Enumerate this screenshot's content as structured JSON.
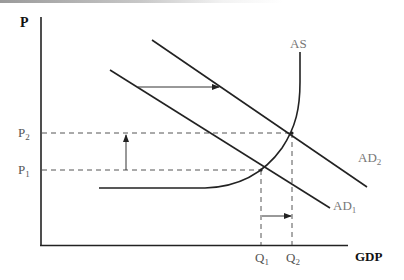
{
  "diagram": {
    "axes": {
      "y_label": "P",
      "x_label": "GDP"
    },
    "price_levels": [
      {
        "id": "P1",
        "base": "P",
        "sub": "1"
      },
      {
        "id": "P2",
        "base": "P",
        "sub": "2"
      }
    ],
    "quantities": [
      {
        "id": "Q1",
        "base": "Q",
        "sub": "1"
      },
      {
        "id": "Q2",
        "base": "Q",
        "sub": "2"
      }
    ],
    "curves": {
      "as": {
        "label": "AS"
      },
      "ad1": {
        "base": "AD",
        "sub": "1"
      },
      "ad2": {
        "base": "AD",
        "sub": "2"
      }
    },
    "arrows": [
      {
        "id": "ad-shift",
        "direction": "right",
        "meaning": "AD shifts from AD1 to AD2"
      },
      {
        "id": "price-rise",
        "direction": "up",
        "meaning": "Price rises from P1 to P2"
      },
      {
        "id": "output-rise",
        "direction": "right",
        "meaning": "Output rises from Q1 to Q2"
      }
    ],
    "colors": {
      "line": "#222222",
      "dashed": "#555555",
      "text": "#333333"
    }
  }
}
